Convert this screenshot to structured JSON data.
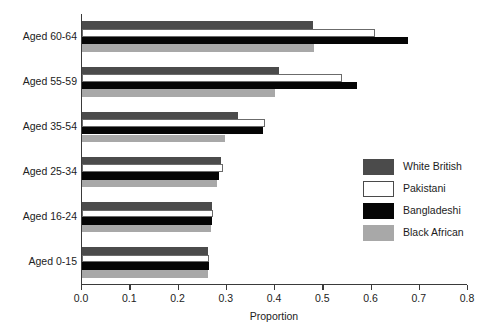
{
  "chart_data": {
    "type": "bar",
    "orientation": "horizontal",
    "title": "",
    "xlabel": "Proportion",
    "ylabel": "",
    "xlim": [
      0.0,
      0.8
    ],
    "xticks": [
      "0.0",
      "0.1",
      "0.2",
      "0.3",
      "0.4",
      "0.5",
      "0.6",
      "0.7",
      "0.8"
    ],
    "grid": false,
    "legend_position": "middle-right",
    "categories": [
      "Aged 0-15",
      "Aged 16-24",
      "Aged 25-34",
      "Aged 35-54",
      "Aged 55-59",
      "Aged 60-64"
    ],
    "series": [
      {
        "name": "White British",
        "color": "#4b4b4b",
        "values": [
          0.262,
          0.269,
          0.288,
          0.323,
          0.408,
          0.479
        ]
      },
      {
        "name": "Pakistani",
        "color": "#ffffff",
        "values": [
          0.264,
          0.271,
          0.292,
          0.379,
          0.538,
          0.608
        ]
      },
      {
        "name": "Bangladeshi",
        "color": "#050505",
        "values": [
          0.263,
          0.269,
          0.283,
          0.375,
          0.569,
          0.675
        ]
      },
      {
        "name": "Black African",
        "color": "#a8a8a8",
        "values": [
          0.261,
          0.267,
          0.279,
          0.296,
          0.4,
          0.481
        ]
      }
    ]
  },
  "legend": {
    "items": [
      {
        "label": "White British"
      },
      {
        "label": "Pakistani"
      },
      {
        "label": "Bangladeshi"
      },
      {
        "label": "Black African"
      }
    ]
  },
  "axis": {
    "x_title": "Proportion"
  }
}
